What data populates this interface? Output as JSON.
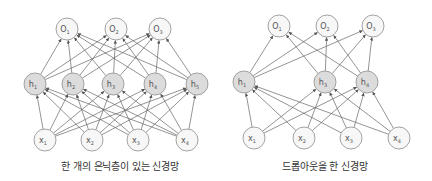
{
  "colors": {
    "edge": "#666666",
    "node_stroke": "#999999",
    "hidden_fill": "#dcdcdc",
    "io_fill": "#f7f7f7",
    "caption": "#333333"
  },
  "node_radius": 11,
  "diagrams": [
    {
      "id": "full",
      "caption": "한 개의 은닉층이 있는 신경망",
      "caption_pos": {
        "x": 120,
        "y": 158
      },
      "outputs": [
        {
          "label": "O",
          "sub": "1",
          "x": 67,
          "y": 29
        },
        {
          "label": "O",
          "sub": "2",
          "x": 116,
          "y": 29
        },
        {
          "label": "O",
          "sub": "3",
          "x": 160,
          "y": 29
        }
      ],
      "hidden": [
        {
          "label": "h",
          "sub": "1",
          "x": 35,
          "y": 84
        },
        {
          "label": "h",
          "sub": "2",
          "x": 73,
          "y": 84
        },
        {
          "label": "h",
          "sub": "3",
          "x": 113,
          "y": 84
        },
        {
          "label": "h",
          "sub": "4",
          "x": 155,
          "y": 84
        },
        {
          "label": "h",
          "sub": "5",
          "x": 197,
          "y": 84
        }
      ],
      "inputs": [
        {
          "label": "x",
          "sub": "1",
          "x": 45,
          "y": 140
        },
        {
          "label": "x",
          "sub": "2",
          "x": 92,
          "y": 140
        },
        {
          "label": "x",
          "sub": "3",
          "x": 138,
          "y": 140
        },
        {
          "label": "x",
          "sub": "4",
          "x": 187,
          "y": 140
        }
      ]
    },
    {
      "id": "dropout",
      "caption": "드롭아웃을 한 신경망",
      "caption_pos": {
        "x": 325,
        "y": 158
      },
      "outputs": [
        {
          "label": "O",
          "sub": "1",
          "x": 279,
          "y": 26
        },
        {
          "label": "O",
          "sub": "2",
          "x": 327,
          "y": 26
        },
        {
          "label": "O",
          "sub": "3",
          "x": 373,
          "y": 26
        }
      ],
      "hidden": [
        {
          "label": "h",
          "sub": "1",
          "x": 244,
          "y": 82
        },
        {
          "label": "h",
          "sub": "3",
          "x": 325,
          "y": 82
        },
        {
          "label": "h",
          "sub": "4",
          "x": 367,
          "y": 82
        }
      ],
      "inputs": [
        {
          "label": "x",
          "sub": "1",
          "x": 254,
          "y": 138
        },
        {
          "label": "x",
          "sub": "2",
          "x": 304,
          "y": 138
        },
        {
          "label": "x",
          "sub": "3",
          "x": 351,
          "y": 138
        },
        {
          "label": "x",
          "sub": "4",
          "x": 399,
          "y": 138
        }
      ]
    }
  ]
}
